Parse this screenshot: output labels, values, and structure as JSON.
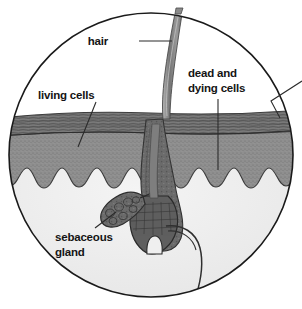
{
  "figure": {
    "shape": "circular magnified view",
    "background_color": "#ffffff",
    "outline_color": "#1a1a1a"
  },
  "labels": {
    "hair": {
      "text": "hair",
      "position": "top-center-left",
      "leader": "horizontal line to hair shaft"
    },
    "living_cells": {
      "text": "living cells",
      "position": "upper-left",
      "leader": "diagonal line down-right to lower epidermis"
    },
    "dead_and_dying_cells": {
      "line1": "dead and",
      "line2": "dying cells",
      "position": "upper-right",
      "leader": "vertical line down to upper epidermis"
    },
    "sebaceous_gland": {
      "line1": "sebaceous",
      "line2": "gland",
      "position": "lower-left",
      "leader": "diagonal line up-right to gland"
    }
  },
  "structures": {
    "hair_shaft": {
      "name": "hair shaft",
      "color": "#8c8c8c"
    },
    "stratum_corneum": {
      "name": "dead and dying cells layer",
      "color": "#6f6f6f"
    },
    "living_epidermis": {
      "name": "living cells layer",
      "color": "#8f8f8f"
    },
    "dermis": {
      "name": "dermis",
      "color": "#ededed"
    },
    "follicle": {
      "name": "hair follicle",
      "color": "#6b6b6b"
    },
    "hair_bulb": {
      "name": "hair bulb with papilla",
      "color": "#5f5f5f"
    },
    "sebaceous_gland_body": {
      "name": "sebaceous gland",
      "color": "#6b6b6b"
    },
    "vessel": {
      "name": "blood vessel",
      "color": "#3a3a3a"
    }
  },
  "colors": {
    "outline": "#1a1a1a",
    "text": "#141414",
    "leader_line": "#2b2b2b",
    "dermis_fill": "#ededed",
    "epidermis_dark": "#6f6f6f",
    "epidermis_mid": "#8f8f8f"
  }
}
